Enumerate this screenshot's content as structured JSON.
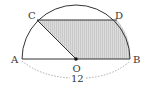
{
  "diagram": {
    "points": {
      "A": {
        "label": "A"
      },
      "B": {
        "label": "B"
      },
      "C": {
        "label": "C"
      },
      "D": {
        "label": "D"
      },
      "O": {
        "label": "O"
      }
    },
    "dimension": {
      "segment": "AB",
      "label": "12"
    },
    "colors": {
      "stroke": "#333333",
      "shade": "#d9d9d9",
      "hatch": "#bdbdbd",
      "dashed": "#888888"
    }
  }
}
